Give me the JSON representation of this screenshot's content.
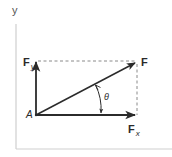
{
  "diagram": {
    "type": "vector-decomposition",
    "axes": {
      "y_label": "y",
      "color": "#c8c8c8"
    },
    "origin_label": "A",
    "vectors": [
      {
        "name": "F",
        "label": "F",
        "subscript": "",
        "from": [
          36,
          115
        ],
        "to": [
          137,
          62
        ]
      },
      {
        "name": "Fx",
        "label": "F",
        "subscript": "x",
        "from": [
          36,
          115
        ],
        "to": [
          137,
          115
        ]
      },
      {
        "name": "Fy",
        "label": "F",
        "subscript": "y",
        "from": [
          36,
          115
        ],
        "to": [
          36,
          61
        ]
      }
    ],
    "angle": {
      "symbol": "θ",
      "between": [
        "F",
        "Fx"
      ]
    },
    "colors": {
      "vector": "#2b2b2b",
      "dashed": "#8a8a8a",
      "axis": "#cfcfcf",
      "text": "#2a2a2a"
    }
  }
}
